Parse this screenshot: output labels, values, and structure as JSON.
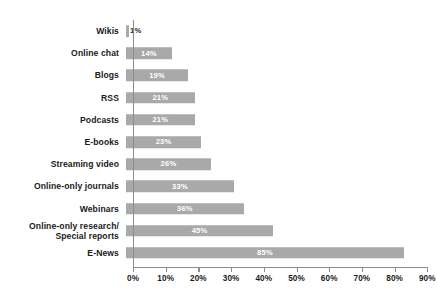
{
  "chart_data": {
    "type": "bar",
    "orientation": "horizontal",
    "title": "",
    "subtitle": "",
    "xlabel": "",
    "ylabel": "",
    "xlim": [
      0,
      95
    ],
    "grid": false,
    "legend": null,
    "bar_color": "#a9a9a9",
    "axis_color": "#8d8d8d",
    "value_label_color": "#ffffff",
    "value_label_color_outside": "#2b2b2b",
    "categories": [
      "Wikis",
      "Online chat",
      "Blogs",
      "RSS",
      "Podcasts",
      "E-books",
      "Streaming video",
      "Online-only journals",
      "Webinars",
      "Online-only research/\nSpecial reports",
      "E-News"
    ],
    "values": [
      1,
      14,
      19,
      21,
      21,
      23,
      26,
      33,
      36,
      45,
      85
    ],
    "value_labels": [
      "1%",
      "14%",
      "19%",
      "21%",
      "21%",
      "23%",
      "26%",
      "33%",
      "36%",
      "45%",
      "85%"
    ],
    "xticks": [
      0,
      10,
      20,
      30,
      40,
      50,
      60,
      70,
      80,
      90
    ],
    "xtick_labels": [
      "0%",
      "10%",
      "20%",
      "30%",
      "40%",
      "50%",
      "60%",
      "70%",
      "80%",
      "90%"
    ]
  }
}
